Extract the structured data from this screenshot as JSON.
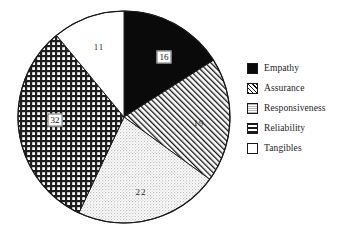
{
  "chart_data": {
    "type": "pie",
    "title": "",
    "subtitle": "",
    "xlabel": "",
    "ylabel": "",
    "grid": false,
    "legend_position": "right",
    "units": "percent",
    "total": 100,
    "start_angle_deg": 0,
    "direction": "clockwise",
    "categories": [
      "Empathy",
      "Assurance",
      "Responsiveness",
      "Reliability",
      "Tangibles"
    ],
    "values": [
      16,
      19,
      22,
      32,
      11
    ],
    "slices": [
      {
        "label": "Empathy",
        "value": 16,
        "value_text": "16",
        "fill": "solid-black",
        "color": "#0a0a0a",
        "label_x": 164,
        "label_y": 57,
        "label_boxed": true
      },
      {
        "label": "Assurance",
        "value": 19,
        "value_text": "19",
        "fill": "diagonal-hatch",
        "color": "#ffffff",
        "label_x": 199,
        "label_y": 123,
        "label_boxed": false
      },
      {
        "label": "Responsiveness",
        "value": 22,
        "value_text": "22",
        "fill": "fine-dots",
        "color": "#f0f0f0",
        "label_x": 141,
        "label_y": 192,
        "label_boxed": false
      },
      {
        "label": "Reliability",
        "value": 32,
        "value_text": "32",
        "fill": "crosshatch",
        "color": "#9a9a9a",
        "label_x": 55,
        "label_y": 120,
        "label_boxed": true
      },
      {
        "label": "Tangibles",
        "value": 11,
        "value_text": "11",
        "fill": "none-white",
        "color": "#ffffff",
        "label_x": 99,
        "label_y": 47,
        "label_boxed": false
      }
    ]
  },
  "legend": {
    "items": [
      {
        "label": "Empathy",
        "swatch": "solid-black-swatch"
      },
      {
        "label": "Assurance",
        "swatch": "diagonal-hatch-swatch"
      },
      {
        "label": "Responsiveness",
        "swatch": "fine-dots-swatch"
      },
      {
        "label": "Reliability",
        "swatch": "crosshatch-swatch"
      },
      {
        "label": "Tangibles",
        "swatch": "empty-white-swatch"
      }
    ]
  },
  "style": {
    "outline_color": "#1a1a1a",
    "background": "#ffffff"
  }
}
